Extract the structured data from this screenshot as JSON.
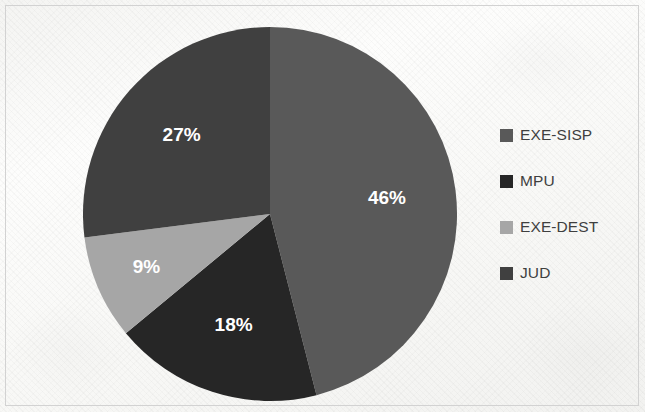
{
  "chart_data": {
    "type": "pie",
    "title": "",
    "categories": [
      "EXE-SISP",
      "MPU",
      "EXE-DEST",
      "JUD"
    ],
    "values": [
      46,
      18,
      9,
      27
    ],
    "value_labels": [
      "46%",
      "18%",
      "9%",
      "27%"
    ],
    "unit": "%",
    "start_angle_deg": 0,
    "direction": "clockwise",
    "legend_position": "right",
    "grid": false,
    "colors": [
      "#595959",
      "#262626",
      "#a6a6a6",
      "#404040"
    ],
    "label_color": "#ffffff",
    "slices": [
      {
        "name": "EXE-SISP",
        "value": 46,
        "label": "46%",
        "color": "#595959"
      },
      {
        "name": "MPU",
        "value": 18,
        "label": "18%",
        "color": "#262626"
      },
      {
        "name": "EXE-DEST",
        "value": 9,
        "label": "9%",
        "color": "#a6a6a6"
      },
      {
        "name": "JUD",
        "value": 27,
        "label": "27%",
        "color": "#404040"
      }
    ]
  },
  "legend": {
    "items": [
      {
        "label": "EXE-SISP",
        "color": "#595959"
      },
      {
        "label": "MPU",
        "color": "#262626"
      },
      {
        "label": "EXE-DEST",
        "color": "#a6a6a6"
      },
      {
        "label": "JUD",
        "color": "#404040"
      }
    ]
  },
  "labels": {
    "slice_0": "46%",
    "slice_1": "18%",
    "slice_2": "9%",
    "slice_3": "27%"
  }
}
